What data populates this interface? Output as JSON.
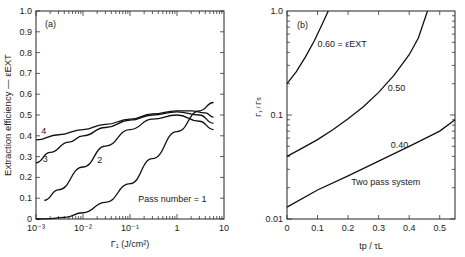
{
  "chart_data": [
    {
      "id": "a",
      "panel_label": "(a)",
      "type": "line",
      "title": "",
      "xlabel": "Γ₁ (J/cm²)",
      "ylabel": "Extraction efficiency — εEXT",
      "xscale": "log",
      "xlim": [
        0.001,
        10
      ],
      "ylim": [
        0,
        1.0
      ],
      "xticks": [
        "10⁻³",
        "10⁻²",
        "10⁻¹",
        "1",
        "10"
      ],
      "yticks": [
        "0",
        "0.1",
        "0.2",
        "0.3",
        "0.4",
        "0.5",
        "0.6",
        "0.7",
        "0.8",
        "0.9",
        "1.0"
      ],
      "annotation": "Pass number = 1",
      "series": [
        {
          "name": "1",
          "label": "Pass number = 1",
          "x": [
            0.001,
            0.002,
            0.004,
            0.01,
            0.03,
            0.1,
            0.3,
            1,
            3,
            6
          ],
          "y": [
            0.0,
            0.002,
            0.008,
            0.03,
            0.08,
            0.17,
            0.29,
            0.42,
            0.52,
            0.56
          ]
        },
        {
          "name": "2",
          "label": "2",
          "x": [
            0.0015,
            0.003,
            0.01,
            0.03,
            0.1,
            0.3,
            1,
            3,
            6
          ],
          "y": [
            0.09,
            0.14,
            0.25,
            0.35,
            0.43,
            0.48,
            0.5,
            0.47,
            0.43
          ]
        },
        {
          "name": "3",
          "label": "3",
          "x": [
            0.001,
            0.002,
            0.005,
            0.01,
            0.03,
            0.1,
            0.3,
            1,
            3,
            6
          ],
          "y": [
            0.27,
            0.32,
            0.37,
            0.4,
            0.44,
            0.475,
            0.5,
            0.515,
            0.5,
            0.46
          ]
        },
        {
          "name": "4",
          "label": "4",
          "x": [
            0.001,
            0.003,
            0.01,
            0.03,
            0.1,
            0.3,
            1,
            2,
            4,
            6
          ],
          "y": [
            0.38,
            0.405,
            0.43,
            0.455,
            0.48,
            0.505,
            0.52,
            0.52,
            0.51,
            0.49
          ]
        }
      ],
      "series_labels_pos": {
        "4": [
          0.0013,
          0.41
        ],
        "3": [
          0.0014,
          0.275
        ],
        "2": [
          0.02,
          0.27
        ]
      }
    },
    {
      "id": "b",
      "panel_label": "(b)",
      "type": "line",
      "title": "",
      "xlabel": "tp / τL",
      "ylabel": "Γ₁ / Γs",
      "yscale": "log",
      "xlim": [
        0,
        0.55
      ],
      "ylim": [
        0.01,
        1.0
      ],
      "xticks": [
        "0",
        "0.1",
        "0.2",
        "0.3",
        "0.4",
        "0.5"
      ],
      "yticks": [
        "0.01",
        "0.1",
        "1.0"
      ],
      "annotation": "Two pass system",
      "series": [
        {
          "name": "0.60",
          "label": "0.60 = εEXT",
          "x": [
            0,
            0.03,
            0.06,
            0.09,
            0.12,
            0.135
          ],
          "y": [
            0.2,
            0.26,
            0.36,
            0.52,
            0.8,
            1.0
          ]
        },
        {
          "name": "0.50",
          "label": "0.50",
          "x": [
            0,
            0.05,
            0.1,
            0.15,
            0.2,
            0.25,
            0.3,
            0.35,
            0.4,
            0.43,
            0.46
          ],
          "y": [
            0.04,
            0.048,
            0.058,
            0.072,
            0.092,
            0.12,
            0.165,
            0.24,
            0.38,
            0.55,
            1.0
          ]
        },
        {
          "name": "0.40",
          "label": "0.40",
          "x": [
            0,
            0.1,
            0.2,
            0.3,
            0.4,
            0.5,
            0.55
          ],
          "y": [
            0.013,
            0.019,
            0.026,
            0.036,
            0.05,
            0.07,
            0.09
          ]
        }
      ]
    }
  ]
}
